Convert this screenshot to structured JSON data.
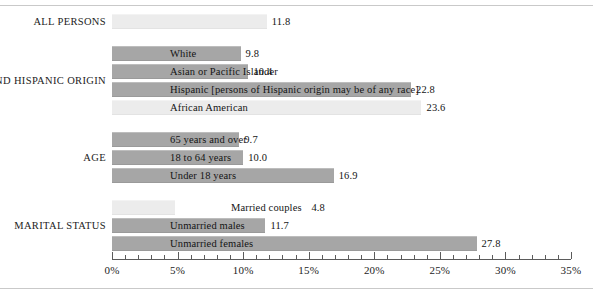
{
  "chart_data": {
    "type": "bar",
    "orientation": "horizontal",
    "title": "",
    "xlabel": "",
    "ylabel": "",
    "xlim": [
      0,
      35
    ],
    "grid": false,
    "legend": "none",
    "axis": {
      "tick_labels": [
        "0%",
        "5%",
        "10%",
        "15%",
        "20%",
        "25%",
        "30%",
        "35%"
      ],
      "tick_values": [
        0,
        5,
        10,
        15,
        20,
        25,
        30,
        35
      ],
      "minor_tick_interval": 1
    },
    "groups": [
      {
        "name": "ALL PERSONS",
        "bars": [
          {
            "label": "",
            "value": 11.8,
            "value_text": "11.8",
            "shade": "light"
          }
        ]
      },
      {
        "name": "RACE AND HISPANIC ORIGIN",
        "bars": [
          {
            "label": "White",
            "value": 9.8,
            "value_text": "9.8",
            "shade": "dark"
          },
          {
            "label": "Asian or Pacific Islander",
            "value": 10.4,
            "value_text": "10.4",
            "shade": "dark"
          },
          {
            "label": "Hispanic [persons of Hispanic origin may be of any race]",
            "value": 22.8,
            "value_text": "22.8",
            "shade": "dark"
          },
          {
            "label": "African American",
            "value": 23.6,
            "value_text": "23.6",
            "shade": "light"
          }
        ]
      },
      {
        "name": "AGE",
        "bars": [
          {
            "label": "65 years and over",
            "value": 9.7,
            "value_text": "9.7",
            "shade": "dark"
          },
          {
            "label": "18 to 64 years",
            "value": 10.0,
            "value_text": "10.0",
            "shade": "dark"
          },
          {
            "label": "Under 18 years",
            "value": 16.9,
            "value_text": "16.9",
            "shade": "dark"
          }
        ]
      },
      {
        "name": "MARITAL STATUS",
        "bars": [
          {
            "label": "Married couples",
            "value": 4.8,
            "value_text": "4.8",
            "shade": "light",
            "label_outside": true
          },
          {
            "label": "Unmarried males",
            "value": 11.7,
            "value_text": "11.7",
            "shade": "dark"
          },
          {
            "label": "Unmarried females",
            "value": 27.8,
            "value_text": "27.8",
            "shade": "dark"
          }
        ]
      }
    ],
    "colors": {
      "bar_dark": "#a6a6a6",
      "bar_light": "#ececec",
      "text": "#1c1c1c",
      "axis": "#5b5b5b",
      "background": "#ffffff"
    }
  }
}
